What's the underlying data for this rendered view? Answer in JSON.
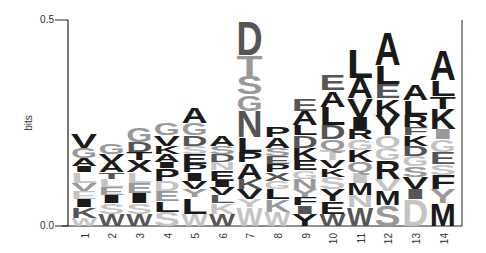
{
  "chart_data": {
    "type": "sequence-logo",
    "title": "",
    "xlabel": "",
    "ylabel": "bits",
    "ylim": [
      0.0,
      0.5
    ],
    "yticks": [
      "0.0",
      "0.5"
    ],
    "categories": [
      "1",
      "2",
      "3",
      "4",
      "5",
      "6",
      "7",
      "8",
      "9",
      "10",
      "11",
      "12",
      "13",
      "14"
    ],
    "colors": {
      "dark": "#1a1a1a",
      "mid": "#555555",
      "light": "#999999",
      "pale": "#c4c4c4"
    },
    "columns": [
      {
        "pos": "1",
        "total": 0.23,
        "letters": [
          [
            "V",
            0.035,
            "dark"
          ],
          [
            "G",
            0.025,
            "light"
          ],
          [
            "A",
            0.02,
            "dark"
          ],
          [
            "I",
            0.015,
            "dark"
          ],
          [
            "L",
            0.025,
            "pale"
          ],
          [
            "V",
            0.02,
            "light"
          ],
          [
            "E",
            0.02,
            "pale"
          ],
          [
            "I",
            0.02,
            "dark"
          ],
          [
            "K",
            0.025,
            "mid"
          ],
          [
            "W",
            0.02,
            "pale"
          ]
        ]
      },
      {
        "pos": "2",
        "total": 0.2,
        "letters": [
          [
            "G",
            0.025,
            "light"
          ],
          [
            "V",
            0.02,
            "dark"
          ],
          [
            "A",
            0.025,
            "dark"
          ],
          [
            "T",
            0.015,
            "mid"
          ],
          [
            "L",
            0.02,
            "pale"
          ],
          [
            "E",
            0.02,
            "light"
          ],
          [
            "I",
            0.02,
            "dark"
          ],
          [
            "S",
            0.025,
            "pale"
          ],
          [
            "W",
            0.03,
            "mid"
          ]
        ]
      },
      {
        "pos": "3",
        "total": 0.24,
        "letters": [
          [
            "G",
            0.035,
            "light"
          ],
          [
            "D",
            0.025,
            "mid"
          ],
          [
            "T",
            0.02,
            "dark"
          ],
          [
            "X",
            0.03,
            "dark"
          ],
          [
            "L",
            0.025,
            "pale"
          ],
          [
            "E",
            0.025,
            "light"
          ],
          [
            "I",
            0.025,
            "dark"
          ],
          [
            "S",
            0.025,
            "pale"
          ],
          [
            "W",
            0.03,
            "mid"
          ]
        ]
      },
      {
        "pos": "4",
        "total": 0.25,
        "letters": [
          [
            "G",
            0.03,
            "light"
          ],
          [
            "V",
            0.025,
            "dark"
          ],
          [
            "K",
            0.02,
            "dark"
          ],
          [
            "A",
            0.02,
            "dark"
          ],
          [
            "I",
            0.015,
            "dark"
          ],
          [
            "P",
            0.03,
            "dark"
          ],
          [
            "D",
            0.025,
            "pale"
          ],
          [
            "E",
            0.025,
            "light"
          ],
          [
            "L",
            0.025,
            "dark"
          ],
          [
            "S",
            0.035,
            "pale"
          ]
        ]
      },
      {
        "pos": "5",
        "total": 0.29,
        "letters": [
          [
            "A",
            0.04,
            "dark"
          ],
          [
            "G",
            0.03,
            "light"
          ],
          [
            "D",
            0.025,
            "mid"
          ],
          [
            "S",
            0.02,
            "pale"
          ],
          [
            "E",
            0.025,
            "dark"
          ],
          [
            "P",
            0.02,
            "dark"
          ],
          [
            "I",
            0.02,
            "dark"
          ],
          [
            "V",
            0.02,
            "dark"
          ],
          [
            "Y",
            0.02,
            "light"
          ],
          [
            "L",
            0.04,
            "dark"
          ],
          [
            "W",
            0.03,
            "pale"
          ]
        ]
      },
      {
        "pos": "6",
        "total": 0.22,
        "letters": [
          [
            "A",
            0.025,
            "dark"
          ],
          [
            "S",
            0.02,
            "light"
          ],
          [
            "D",
            0.02,
            "mid"
          ],
          [
            "N",
            0.02,
            "pale"
          ],
          [
            "E",
            0.025,
            "dark"
          ],
          [
            "I",
            0.015,
            "dark"
          ],
          [
            "V",
            0.02,
            "dark"
          ],
          [
            "L",
            0.02,
            "mid"
          ],
          [
            "K",
            0.025,
            "pale"
          ],
          [
            "W",
            0.03,
            "mid"
          ]
        ]
      },
      {
        "pos": "7",
        "total": 0.5,
        "letters": [
          [
            "D",
            0.085,
            "mid"
          ],
          [
            "T",
            0.05,
            "light"
          ],
          [
            "S",
            0.045,
            "light"
          ],
          [
            "G",
            0.04,
            "light"
          ],
          [
            "N",
            0.065,
            "mid"
          ],
          [
            "L",
            0.035,
            "dark"
          ],
          [
            "P",
            0.025,
            "dark"
          ],
          [
            "A",
            0.04,
            "dark"
          ],
          [
            "K",
            0.025,
            "mid"
          ],
          [
            "V",
            0.025,
            "dark"
          ],
          [
            "Y",
            0.02,
            "pale"
          ],
          [
            "W",
            0.045,
            "pale"
          ]
        ]
      },
      {
        "pos": "8",
        "total": 0.24,
        "letters": [
          [
            "P",
            0.025,
            "dark"
          ],
          [
            "A",
            0.025,
            "dark"
          ],
          [
            "S",
            0.02,
            "light"
          ],
          [
            "E",
            0.02,
            "mid"
          ],
          [
            "P",
            0.02,
            "dark"
          ],
          [
            "X",
            0.02,
            "mid"
          ],
          [
            "G",
            0.02,
            "pale"
          ],
          [
            "L",
            0.025,
            "dark"
          ],
          [
            "K",
            0.03,
            "light"
          ],
          [
            "W",
            0.035,
            "pale"
          ]
        ]
      },
      {
        "pos": "9",
        "total": 0.33,
        "letters": [
          [
            "E",
            0.03,
            "mid"
          ],
          [
            "A",
            0.035,
            "dark"
          ],
          [
            "L",
            0.025,
            "dark"
          ],
          [
            "D",
            0.03,
            "mid"
          ],
          [
            "K",
            0.03,
            "dark"
          ],
          [
            "E",
            0.025,
            "dark"
          ],
          [
            "G",
            0.02,
            "pale"
          ],
          [
            "N",
            0.025,
            "light"
          ],
          [
            "Y",
            0.02,
            "light"
          ],
          [
            "F",
            0.02,
            "dark"
          ],
          [
            "I",
            0.02,
            "mid"
          ],
          [
            "Y",
            0.03,
            "dark"
          ]
        ]
      },
      {
        "pos": "10",
        "total": 0.37,
        "letters": [
          [
            "E",
            0.04,
            "mid"
          ],
          [
            "A",
            0.04,
            "dark"
          ],
          [
            "L",
            0.045,
            "dark"
          ],
          [
            "D",
            0.035,
            "mid"
          ],
          [
            "Q",
            0.025,
            "light"
          ],
          [
            "T",
            0.025,
            "pale"
          ],
          [
            "V",
            0.02,
            "dark"
          ],
          [
            "K",
            0.02,
            "dark"
          ],
          [
            "S",
            0.03,
            "pale"
          ],
          [
            "Y",
            0.03,
            "dark"
          ],
          [
            "E",
            0.03,
            "dark"
          ],
          [
            "W",
            0.03,
            "mid"
          ]
        ]
      },
      {
        "pos": "11",
        "total": 0.43,
        "letters": [
          [
            "L",
            0.07,
            "dark"
          ],
          [
            "A",
            0.05,
            "dark"
          ],
          [
            "V",
            0.045,
            "dark"
          ],
          [
            "I",
            0.03,
            "dark"
          ],
          [
            "R",
            0.025,
            "dark"
          ],
          [
            "G",
            0.025,
            "pale"
          ],
          [
            "K",
            0.03,
            "dark"
          ],
          [
            "Q",
            0.025,
            "light"
          ],
          [
            "I",
            0.025,
            "pale"
          ],
          [
            "M",
            0.03,
            "dark"
          ],
          [
            "N",
            0.03,
            "pale"
          ],
          [
            "W",
            0.045,
            "mid"
          ]
        ]
      },
      {
        "pos": "12",
        "total": 0.47,
        "letters": [
          [
            "A",
            0.08,
            "dark"
          ],
          [
            "L",
            0.045,
            "dark"
          ],
          [
            "E",
            0.035,
            "mid"
          ],
          [
            "K",
            0.04,
            "dark"
          ],
          [
            "Y",
            0.05,
            "dark"
          ],
          [
            "Q",
            0.03,
            "pale"
          ],
          [
            "G",
            0.03,
            "pale"
          ],
          [
            "R",
            0.045,
            "dark"
          ],
          [
            "V",
            0.03,
            "pale"
          ],
          [
            "M",
            0.035,
            "dark"
          ],
          [
            "S",
            0.05,
            "light"
          ]
        ]
      },
      {
        "pos": "13",
        "total": 0.35,
        "letters": [
          [
            "A",
            0.04,
            "dark"
          ],
          [
            "L",
            0.035,
            "dark"
          ],
          [
            "R",
            0.03,
            "dark"
          ],
          [
            "F",
            0.02,
            "mid"
          ],
          [
            "K",
            0.025,
            "dark"
          ],
          [
            "D",
            0.025,
            "mid"
          ],
          [
            "G",
            0.025,
            "pale"
          ],
          [
            "S",
            0.025,
            "light"
          ],
          [
            "V",
            0.03,
            "dark"
          ],
          [
            "I",
            0.025,
            "mid"
          ],
          [
            "D",
            0.065,
            "pale"
          ]
        ]
      },
      {
        "pos": "14",
        "total": 0.43,
        "letters": [
          [
            "A",
            0.075,
            "dark"
          ],
          [
            "L",
            0.04,
            "dark"
          ],
          [
            "T",
            0.03,
            "dark"
          ],
          [
            "K",
            0.05,
            "dark"
          ],
          [
            "I",
            0.025,
            "light"
          ],
          [
            "G",
            0.03,
            "pale"
          ],
          [
            "E",
            0.03,
            "mid"
          ],
          [
            "S",
            0.025,
            "pale"
          ],
          [
            "F",
            0.035,
            "dark"
          ],
          [
            "Y",
            0.035,
            "light"
          ],
          [
            "M",
            0.055,
            "dark"
          ]
        ]
      }
    ]
  }
}
